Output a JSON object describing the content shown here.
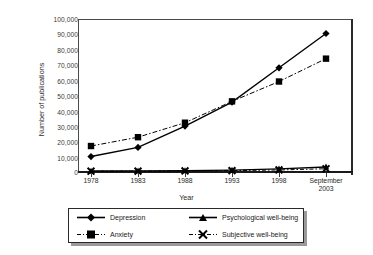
{
  "chart_data": {
    "type": "line",
    "title": "",
    "xlabel": "Year",
    "ylabel": "Number of publications",
    "categories": [
      "1978",
      "1983",
      "1988",
      "1993",
      "1998",
      "September\n2003"
    ],
    "ylim": [
      0,
      100000
    ],
    "ytick_labels": [
      "100,000",
      "90,000",
      "80,000",
      "70,000",
      "60,000",
      "50,000",
      "40,000",
      "30,000",
      "20,000",
      "10,000",
      "0"
    ],
    "ytick_values": [
      100000,
      90000,
      80000,
      70000,
      60000,
      50000,
      40000,
      30000,
      20000,
      10000,
      0
    ],
    "grid": false,
    "legend_position": "below-axis",
    "series": [
      {
        "name": "Depression",
        "marker": "diamond",
        "line_style": "solid",
        "color": "#000000",
        "values": [
          9800,
          15800,
          29800,
          45500,
          68000,
          90500
        ]
      },
      {
        "name": "Anxiety",
        "marker": "square",
        "line_style": "dashed",
        "color": "#000000",
        "values": [
          16700,
          22500,
          32000,
          46000,
          59000,
          74000
        ]
      },
      {
        "name": "Psychological well-being",
        "marker": "triangle",
        "line_style": "solid",
        "color": "#000000",
        "values": [
          300,
          400,
          600,
          900,
          1700,
          3000
        ]
      },
      {
        "name": "Subjective well-being",
        "marker": "x",
        "line_style": "dashed",
        "color": "#000000",
        "values": [
          200,
          250,
          350,
          600,
          1000,
          1800
        ]
      }
    ]
  },
  "axes": {
    "y_title": "Number of publications",
    "x_title": "Year"
  },
  "legend": {
    "entries": [
      {
        "label": "Depression"
      },
      {
        "label": "Psychological well-being"
      },
      {
        "label": "Anxiety"
      },
      {
        "label": "Subjective well-being"
      }
    ]
  }
}
